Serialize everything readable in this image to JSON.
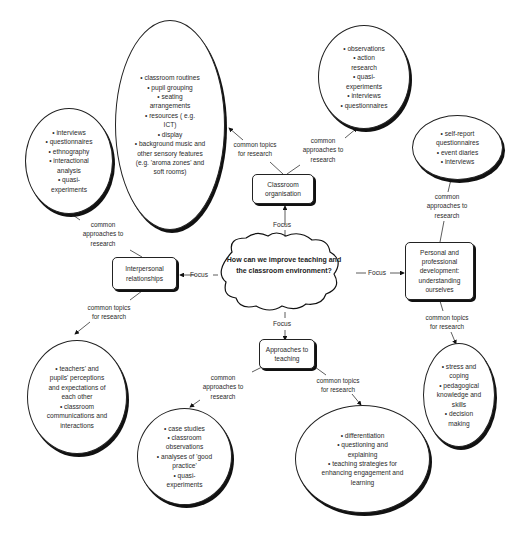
{
  "diagram": {
    "central_question": "How can we improve teaching and the classroom environment?",
    "focus_label": "Focus",
    "link_labels": {
      "topics": "common topics\nfor research",
      "approaches": "common\napproaches to\nresearch",
      "approaches_inline": "common approaches to\nresearch"
    },
    "branches": [
      {
        "name": "Classroom organisation",
        "topics": [
          "classroom routines",
          "pupil grouping",
          "seating arrangements",
          "resources ( e.g. ICT)",
          "display",
          "background music and other sensory features (e.g. 'aroma zones' and soft rooms)"
        ],
        "approaches": [
          "observations",
          "action research",
          "quasi-experiments",
          "interviews",
          "questionnaires"
        ]
      },
      {
        "name": "Interpersonal relationships",
        "approaches": [
          "interviews",
          "questionnaires",
          "ethnography",
          "interactional analysis",
          "quasi-experiments"
        ],
        "topics": [
          "teachers' and pupils' perceptions and expectations of each other",
          "classroom communications and interactions"
        ]
      },
      {
        "name": "Personal and professional development: understanding ourselves",
        "approaches": [
          "self-report questionnaires",
          "event diaries",
          "interviews"
        ],
        "topics": [
          "stress and coping",
          "pedagogical knowledge and skills",
          "decision making"
        ]
      },
      {
        "name": "Approaches to teaching",
        "approaches": [
          "case studies",
          "classroom observations",
          "analyses of 'good practice'",
          "quasi-experiments"
        ],
        "topics": [
          "differentiation",
          "questioning and explaining",
          "teaching strategies for enhancing engagement and learning"
        ]
      }
    ]
  }
}
